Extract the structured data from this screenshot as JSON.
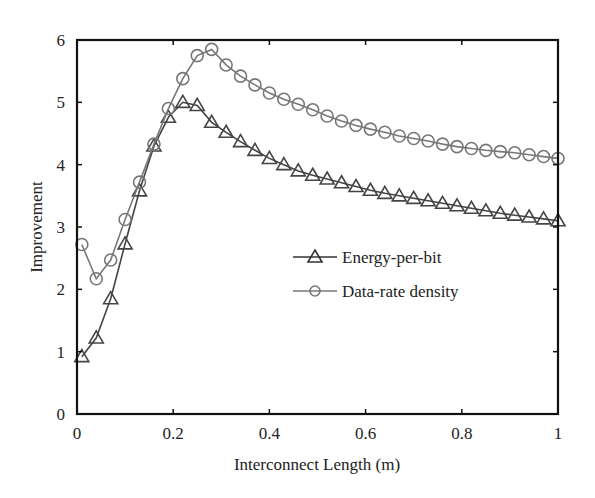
{
  "chart_data": {
    "type": "line",
    "title": "",
    "xlabel": "Interconnect Length (m)",
    "ylabel": "Improvement",
    "xlim": [
      0,
      1
    ],
    "ylim": [
      0,
      6
    ],
    "grid": false,
    "legend_position": "center-right",
    "x_ticks": [
      "0",
      "0.2",
      "0.4",
      "0.6",
      "0.8",
      "1"
    ],
    "y_ticks": [
      "0",
      "1",
      "2",
      "3",
      "4",
      "5",
      "6"
    ],
    "x": [
      0.01,
      0.04,
      0.07,
      0.1,
      0.13,
      0.16,
      0.19,
      0.22,
      0.25,
      0.28,
      0.31,
      0.34,
      0.37,
      0.4,
      0.43,
      0.46,
      0.49,
      0.52,
      0.55,
      0.58,
      0.61,
      0.64,
      0.67,
      0.7,
      0.73,
      0.76,
      0.79,
      0.82,
      0.85,
      0.88,
      0.91,
      0.94,
      0.97,
      1.0
    ],
    "series": [
      {
        "name": "Energy-per-bit",
        "marker": "triangle",
        "color": "#444444",
        "values": [
          0.92,
          1.22,
          1.85,
          2.73,
          3.58,
          4.3,
          4.76,
          5.0,
          4.95,
          4.68,
          4.52,
          4.37,
          4.23,
          4.1,
          4.0,
          3.9,
          3.83,
          3.77,
          3.71,
          3.65,
          3.59,
          3.54,
          3.5,
          3.46,
          3.42,
          3.38,
          3.34,
          3.3,
          3.26,
          3.22,
          3.19,
          3.16,
          3.13,
          3.1
        ]
      },
      {
        "name": "Data-rate density",
        "marker": "circle",
        "color": "#777777",
        "values": [
          2.72,
          2.17,
          2.47,
          3.12,
          3.72,
          4.33,
          4.9,
          5.38,
          5.75,
          5.85,
          5.6,
          5.42,
          5.28,
          5.15,
          5.05,
          4.97,
          4.88,
          4.78,
          4.7,
          4.63,
          4.57,
          4.52,
          4.46,
          4.42,
          4.38,
          4.33,
          4.29,
          4.26,
          4.23,
          4.21,
          4.19,
          4.16,
          4.13,
          4.1
        ]
      }
    ]
  }
}
